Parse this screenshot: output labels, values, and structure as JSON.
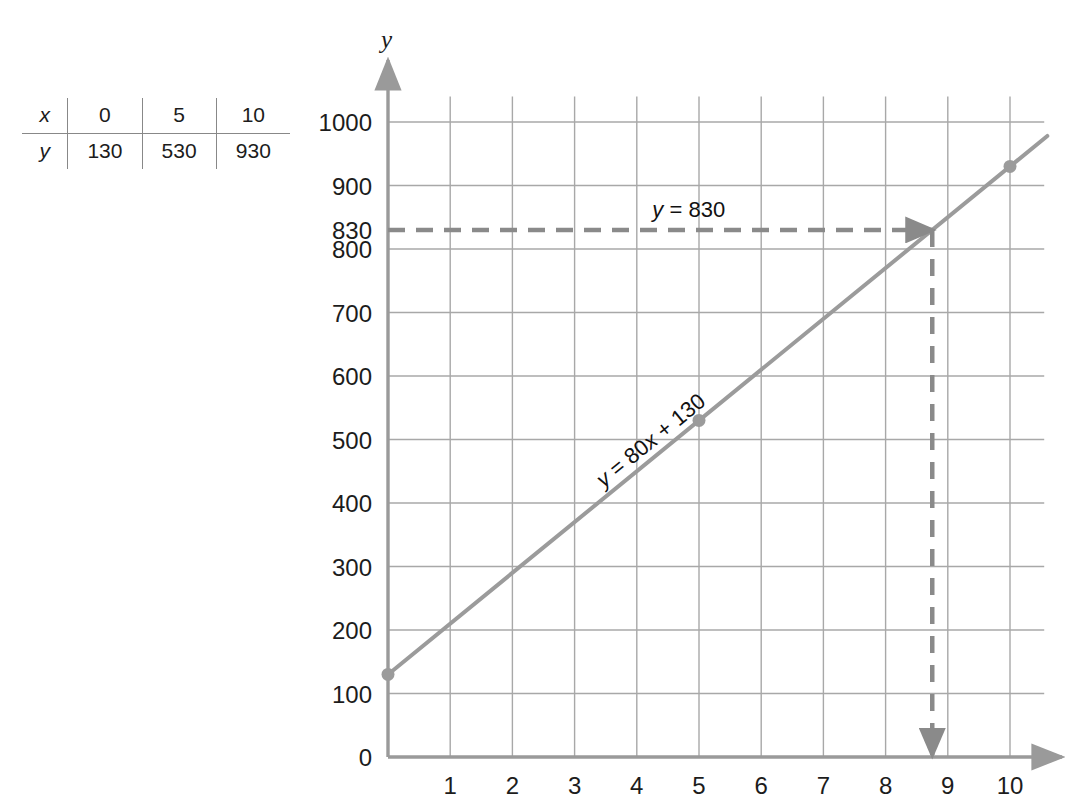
{
  "table": {
    "name": "xy-value-table",
    "rows": [
      {
        "header": "x",
        "values": [
          "0",
          "5",
          "10"
        ]
      },
      {
        "header": "y",
        "values": [
          "130",
          "530",
          "930"
        ]
      }
    ]
  },
  "chart_data": {
    "type": "line",
    "title": "",
    "xlabel": "",
    "ylabel": "y",
    "x": [
      0,
      5,
      10
    ],
    "values": [
      130,
      530,
      930
    ],
    "equation": "y = 80x + 130",
    "slope": 80,
    "intercept": 130,
    "xlim": [
      0,
      10.6
    ],
    "ylim": [
      0,
      1060
    ],
    "xticks": [
      1,
      2,
      3,
      4,
      5,
      6,
      7,
      8,
      9,
      10
    ],
    "xtick_labels": [
      "1",
      "2",
      "3",
      "4",
      "5",
      "6",
      "7",
      "8",
      "9",
      "10"
    ],
    "yticks": [
      0,
      100,
      200,
      300,
      400,
      500,
      600,
      700,
      800,
      830,
      900,
      1000
    ],
    "ytick_labels": [
      "0",
      "100",
      "200",
      "300",
      "400",
      "500",
      "600",
      "700",
      "800",
      "830",
      "900",
      "1000"
    ],
    "grid": true,
    "legend": "none",
    "points": [
      {
        "x": 0,
        "y": 130
      },
      {
        "x": 5,
        "y": 530
      },
      {
        "x": 10,
        "y": 930
      }
    ],
    "annotations": [
      {
        "label": "y = 830",
        "type": "horizontal-dashed-arrow",
        "y": 830,
        "from_x": 0,
        "to_x": 8.75
      },
      {
        "label": "",
        "type": "vertical-dashed-arrow",
        "x": 8.75,
        "from_y": 830,
        "to_y": 0
      },
      {
        "label": "y = 80x + 130",
        "type": "line-label",
        "along_line": true
      }
    ],
    "colors": {
      "line": "#9b9b9b",
      "grid": "#a8a8a8",
      "axis": "#9a9a9a",
      "dash": "#8a8a8a",
      "text": "#1c1c1c"
    }
  },
  "annotations": {
    "y_axis_label": "y",
    "line_equation": "y = 80x + 130",
    "horizontal_line_label": "y = 830"
  }
}
